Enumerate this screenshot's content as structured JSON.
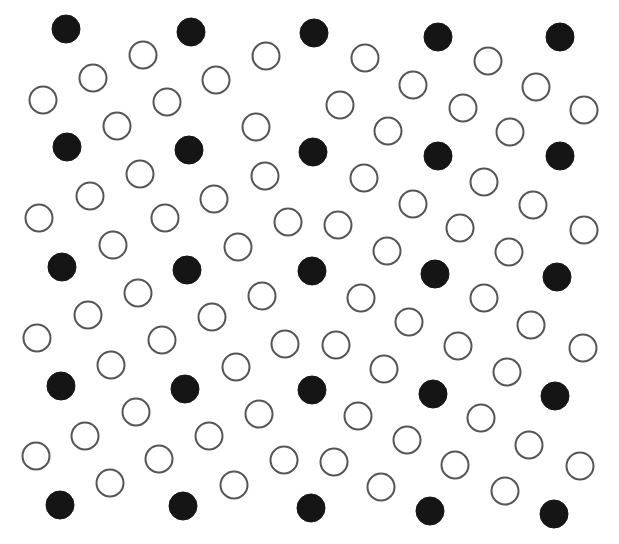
{
  "diagram": {
    "colors": {
      "filled": "#151515",
      "open_stroke": "#555555",
      "background": "#ffffff"
    },
    "radius": 15,
    "filled": [
      [
        66,
        29
      ],
      [
        191,
        32
      ],
      [
        314,
        33
      ],
      [
        438,
        37
      ],
      [
        560,
        37
      ],
      [
        67,
        147
      ],
      [
        189,
        150
      ],
      [
        313,
        152
      ],
      [
        438,
        156
      ],
      [
        560,
        156
      ],
      [
        62,
        267
      ],
      [
        187,
        270
      ],
      [
        312,
        271
      ],
      [
        435,
        274
      ],
      [
        557,
        277
      ],
      [
        61,
        386
      ],
      [
        185,
        389
      ],
      [
        312,
        390
      ],
      [
        433,
        394
      ],
      [
        555,
        396
      ],
      [
        60,
        505
      ],
      [
        183,
        506
      ],
      [
        311,
        508
      ],
      [
        430,
        511
      ],
      [
        554,
        514
      ]
    ],
    "open": [
      [
        143,
        55
      ],
      [
        93,
        78
      ],
      [
        43,
        100
      ],
      [
        167,
        102
      ],
      [
        117,
        126
      ],
      [
        216,
        80
      ],
      [
        266,
        56
      ],
      [
        256,
        127
      ],
      [
        365,
        58
      ],
      [
        413,
        85
      ],
      [
        340,
        105
      ],
      [
        488,
        61
      ],
      [
        463,
        108
      ],
      [
        536,
        87
      ],
      [
        584,
        110
      ],
      [
        388,
        131
      ],
      [
        510,
        132
      ],
      [
        140,
        174
      ],
      [
        90,
        196
      ],
      [
        39,
        218
      ],
      [
        165,
        218
      ],
      [
        113,
        245
      ],
      [
        214,
        199
      ],
      [
        265,
        176
      ],
      [
        288,
        222
      ],
      [
        238,
        247
      ],
      [
        364,
        178
      ],
      [
        413,
        204
      ],
      [
        338,
        225
      ],
      [
        484,
        182
      ],
      [
        460,
        228
      ],
      [
        533,
        205
      ],
      [
        584,
        230
      ],
      [
        387,
        251
      ],
      [
        509,
        252
      ],
      [
        138,
        293
      ],
      [
        88,
        315
      ],
      [
        37,
        338
      ],
      [
        162,
        340
      ],
      [
        111,
        365
      ],
      [
        212,
        317
      ],
      [
        262,
        296
      ],
      [
        285,
        344
      ],
      [
        236,
        367
      ],
      [
        361,
        298
      ],
      [
        409,
        322
      ],
      [
        336,
        345
      ],
      [
        484,
        298
      ],
      [
        458,
        346
      ],
      [
        531,
        325
      ],
      [
        583,
        348
      ],
      [
        384,
        369
      ],
      [
        507,
        372
      ],
      [
        136,
        412
      ],
      [
        85,
        436
      ],
      [
        36,
        456
      ],
      [
        159,
        459
      ],
      [
        110,
        483
      ],
      [
        209,
        436
      ],
      [
        259,
        414
      ],
      [
        284,
        460
      ],
      [
        234,
        485
      ],
      [
        358,
        416
      ],
      [
        407,
        440
      ],
      [
        334,
        462
      ],
      [
        481,
        418
      ],
      [
        455,
        465
      ],
      [
        529,
        445
      ],
      [
        580,
        466
      ],
      [
        381,
        487
      ],
      [
        505,
        491
      ]
    ]
  }
}
